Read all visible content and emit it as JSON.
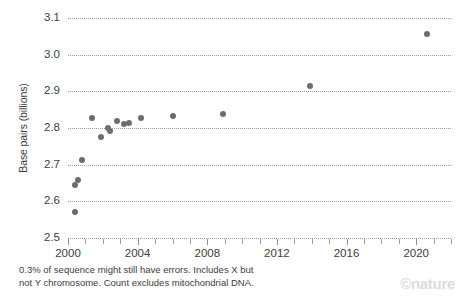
{
  "chart_data": {
    "type": "scatter",
    "title": "",
    "subtitle": "",
    "xlabel": "",
    "ylabel": "Base pairs (billions)",
    "xlim": [
      2000,
      2022
    ],
    "ylim": [
      2.5,
      3.1
    ],
    "ytick_labels": [
      "3.1",
      "3.0",
      "2.9",
      "2.8",
      "2.7",
      "2.6",
      "2.5"
    ],
    "ytick_values": [
      3.1,
      3.0,
      2.9,
      2.8,
      2.7,
      2.6,
      2.5
    ],
    "xtick_labels": [
      "2000",
      "2004",
      "2008",
      "2012",
      "2016",
      "2020"
    ],
    "xtick_values": [
      2000,
      2004,
      2008,
      2012,
      2016,
      2020
    ],
    "xtick_minor_values": [
      2001,
      2002,
      2003,
      2005,
      2006,
      2007,
      2009,
      2010,
      2011,
      2013,
      2014,
      2015,
      2017,
      2018,
      2019,
      2021,
      2022
    ],
    "grid": "horizontal-dotted",
    "legend": "none",
    "marker_color": "#6d6d6d",
    "points": [
      {
        "x": 2000.4,
        "y": 2.57
      },
      {
        "x": 2000.4,
        "y": 2.645
      },
      {
        "x": 2000.6,
        "y": 2.658
      },
      {
        "x": 2000.8,
        "y": 2.712
      },
      {
        "x": 2001.4,
        "y": 2.828
      },
      {
        "x": 2001.9,
        "y": 2.775
      },
      {
        "x": 2002.3,
        "y": 2.8
      },
      {
        "x": 2002.4,
        "y": 2.792
      },
      {
        "x": 2002.8,
        "y": 2.82
      },
      {
        "x": 2003.2,
        "y": 2.811
      },
      {
        "x": 2003.5,
        "y": 2.815
      },
      {
        "x": 2004.2,
        "y": 2.827
      },
      {
        "x": 2006.0,
        "y": 2.834
      },
      {
        "x": 2008.9,
        "y": 2.837
      },
      {
        "x": 2013.9,
        "y": 2.914
      },
      {
        "x": 2020.6,
        "y": 3.057
      }
    ]
  },
  "footnote": {
    "line1": "0.3% of sequence might still have errors. Includes X but",
    "line2": "not Y chromosome. Count excludes mitochondrial DNA."
  },
  "branding": {
    "logo": "©nature"
  }
}
